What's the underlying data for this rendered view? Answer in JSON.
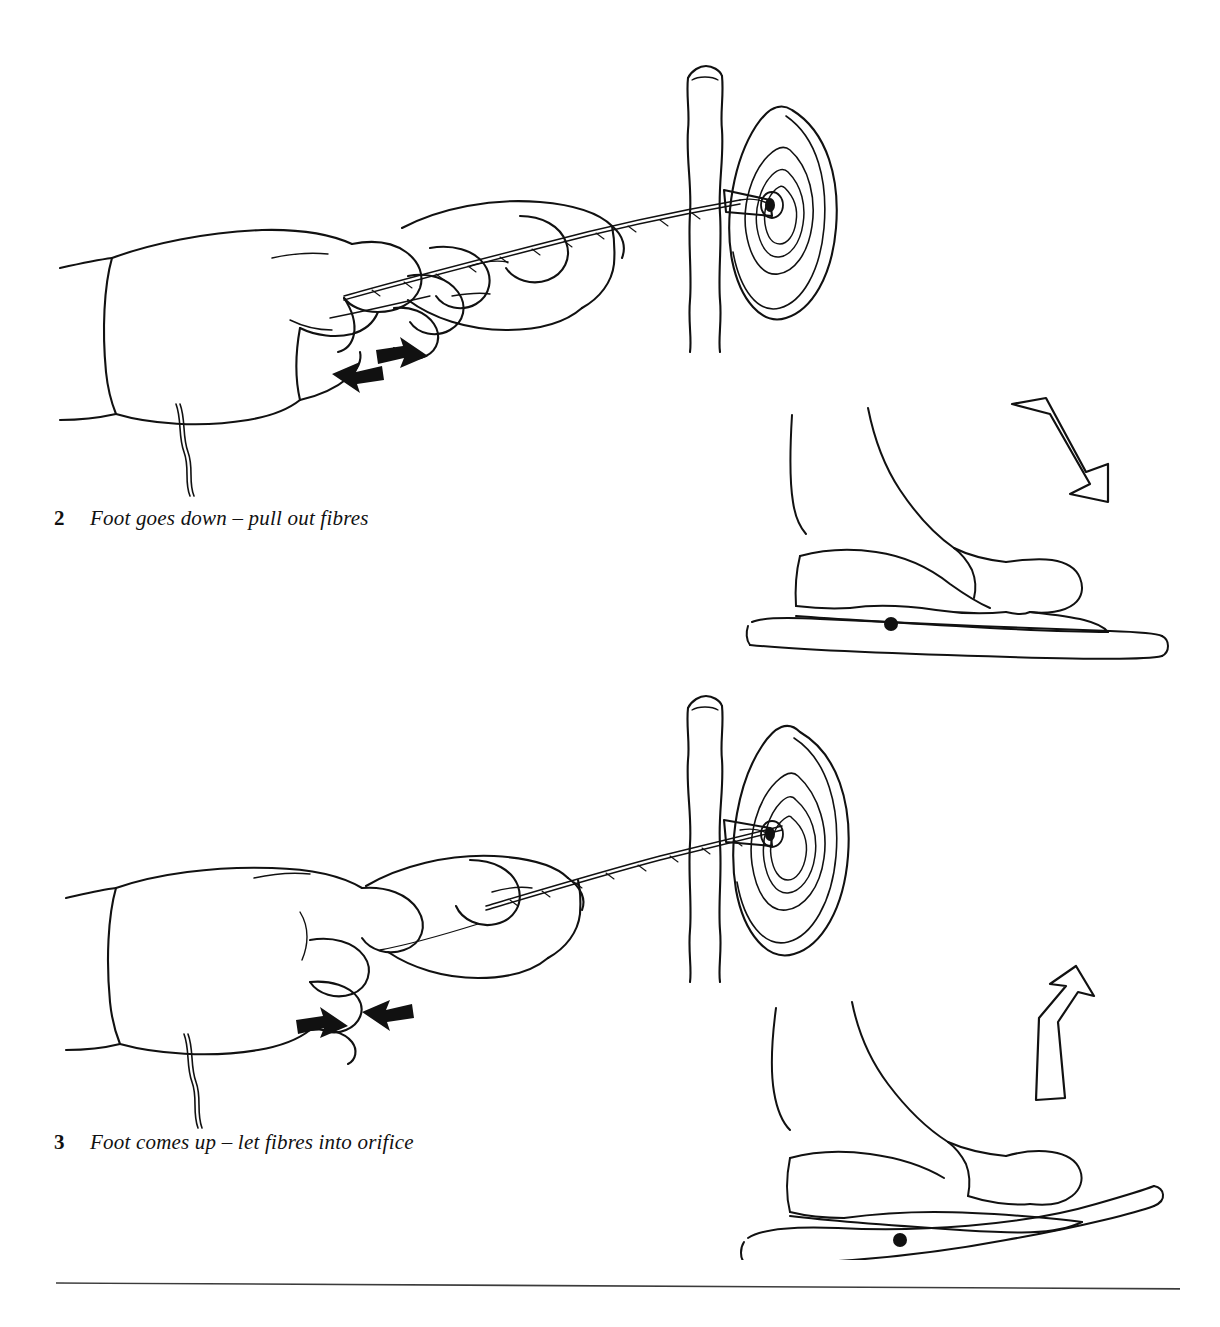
{
  "page": {
    "background_color": "#ffffff",
    "ink_color": "#111111",
    "width": 1220,
    "height": 1327,
    "kind": "book-page-line-drawing"
  },
  "steps": [
    {
      "number": "2",
      "text": "Foot goes down – pull out fibres",
      "hand_arrow_direction": "apart",
      "hand_arrow_left_label": "arrow-left",
      "hand_arrow_right_label": "arrow-right",
      "foot_arrow_direction": "down",
      "treadle_state": "level",
      "figure_names": [
        "spinner-hands-drafting-fibre",
        "spindle-with-whorl",
        "foot-on-treadle-pressing-down",
        "treadle-bar"
      ]
    },
    {
      "number": "3",
      "text": "Foot comes up – let fibres into orifice",
      "hand_arrow_direction": "together",
      "hand_arrow_left_label": "arrow-right",
      "hand_arrow_right_label": "arrow-left",
      "foot_arrow_direction": "up",
      "treadle_state": "tilted",
      "figure_names": [
        "spinner-hands-feeding-fibre",
        "spindle-with-whorl",
        "foot-on-treadle-lifting-up",
        "treadle-bar"
      ]
    }
  ],
  "footer": {
    "rule_label": "horizontal-rule"
  }
}
